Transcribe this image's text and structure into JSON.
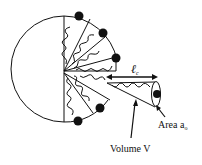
{
  "diagram": {
    "labels": {
      "length": "ℓ",
      "length_sub": "c",
      "area": "Area a",
      "area_sub": "o",
      "volume": "Volume V"
    },
    "colors": {
      "stroke": "#111111",
      "head": "#111111",
      "background": "#ffffff"
    },
    "elements": {
      "micelle_half": "semicircle cross-section",
      "wedges_upper": 3,
      "wedges_lower": 2,
      "head_groups": 5,
      "detached_cone": "single surfactant cone with head group"
    }
  }
}
